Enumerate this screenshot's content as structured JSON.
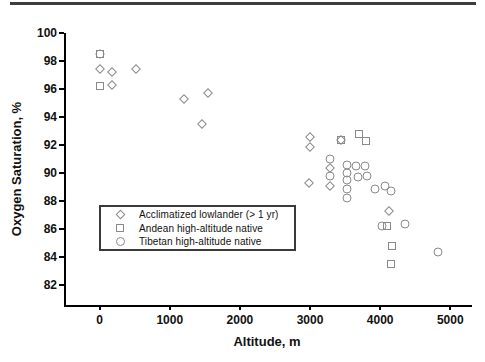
{
  "chart_data": {
    "type": "scatter",
    "title": "",
    "xlabel": "Altitude, m",
    "ylabel": "Oxygen Saturation, %",
    "xlim": [
      -480,
      5310
    ],
    "ylim": [
      80.6,
      100
    ],
    "x_ticks": [
      0,
      1000,
      2000,
      3000,
      4000,
      5000
    ],
    "y_ticks": [
      82,
      84,
      86,
      88,
      90,
      92,
      94,
      96,
      98,
      100
    ],
    "grid": false,
    "legend_position": "inside-lower-left",
    "marker_outline_color": "#8a8a8a",
    "axis_color": "#000000",
    "series": [
      {
        "name": "Acclimatized lowlander (> 1 yr)",
        "marker": "diamond",
        "points": [
          [
            0,
            97.4
          ],
          [
            180,
            97.2
          ],
          [
            520,
            97.4
          ],
          [
            180,
            96.3
          ],
          [
            1200,
            95.3
          ],
          [
            1550,
            95.7
          ],
          [
            1460,
            93.5
          ],
          [
            3000,
            92.6
          ],
          [
            3000,
            91.9
          ],
          [
            2980,
            89.3
          ],
          [
            3290,
            90.4
          ],
          [
            3290,
            89.1
          ],
          [
            3440,
            92.4
          ],
          [
            4130,
            87.3
          ]
        ]
      },
      {
        "name": "Andean high-altitude native",
        "marker": "square",
        "points": [
          [
            0,
            98.5
          ],
          [
            0,
            96.2
          ],
          [
            3440,
            92.4
          ],
          [
            3700,
            92.8
          ],
          [
            3800,
            92.3
          ],
          [
            4095,
            86.2
          ],
          [
            4175,
            84.8
          ],
          [
            4155,
            83.5
          ]
        ]
      },
      {
        "name": "Tibetan high-altitude native",
        "marker": "circle",
        "points": [
          [
            0,
            98.5
          ],
          [
            3290,
            91.0
          ],
          [
            3290,
            89.8
          ],
          [
            3530,
            90.6
          ],
          [
            3530,
            90.0
          ],
          [
            3530,
            89.5
          ],
          [
            3530,
            88.9
          ],
          [
            3530,
            88.2
          ],
          [
            3655,
            90.5
          ],
          [
            3790,
            90.5
          ],
          [
            3690,
            89.7
          ],
          [
            3810,
            89.8
          ],
          [
            3930,
            88.9
          ],
          [
            4070,
            89.1
          ],
          [
            4160,
            88.7
          ],
          [
            4025,
            86.2
          ],
          [
            4355,
            86.4
          ],
          [
            4820,
            84.4
          ]
        ]
      }
    ]
  }
}
